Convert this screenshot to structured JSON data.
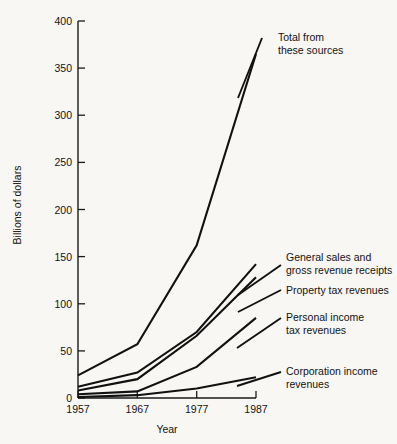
{
  "chart_data": {
    "type": "line",
    "title": "",
    "xlabel": "Year",
    "ylabel": "Billions of dollars",
    "x": [
      1957,
      1967,
      1977,
      1987
    ],
    "xtick_labels": [
      "1957",
      "1967",
      "1977",
      "1987"
    ],
    "ytick_labels": [
      "0",
      "50",
      "100",
      "150",
      "200",
      "250",
      "300",
      "350",
      "400"
    ],
    "yticks": [
      0,
      50,
      100,
      150,
      200,
      250,
      300,
      350,
      400
    ],
    "ylim": [
      0,
      400
    ],
    "grid": false,
    "legend_position": "inline-annotations-right",
    "series": [
      {
        "name": "Total from these sources",
        "label": "Total from these sources",
        "label_line1": "Total from",
        "label_line2": "these sources",
        "values": [
          24,
          57,
          162,
          365
        ]
      },
      {
        "name": "General sales and gross revenue receipts",
        "label": "General sales and gross revenue receipts",
        "label_line1": "General sales and",
        "label_line2": "gross revenue receipts",
        "values": [
          12,
          27,
          70,
          142
        ]
      },
      {
        "name": "Property tax revenues",
        "label": "Property tax revenues",
        "label_line1": "Property tax revenues",
        "label_line2": "",
        "values": [
          8,
          20,
          66,
          128
        ]
      },
      {
        "name": "Personal income tax revenues",
        "label": "Personal income tax revenues",
        "label_line1": "Personal income",
        "label_line2": "tax revenues",
        "values": [
          4,
          7,
          33,
          85
        ]
      },
      {
        "name": "Corporation income revenues",
        "label": "Corporation income revenues",
        "label_line1": "Corporation income",
        "label_line2": "revenues",
        "values": [
          1,
          3,
          10,
          22
        ]
      }
    ]
  }
}
